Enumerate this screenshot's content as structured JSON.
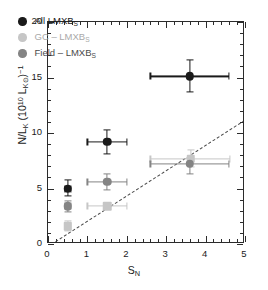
{
  "chart_data": {
    "type": "scatter",
    "title": "",
    "xlabel": "S_N",
    "xlabel_main": "S",
    "xlabel_sub": "N",
    "ylabel": "N/L_K (10^10 L_K⊙)^-1",
    "ylabel_parts": {
      "n_over_l": "N/L",
      "l_sub": "K",
      "paren_open": " (10",
      "exp10": "10",
      "lk": " L",
      "lk_sub": "K⊙",
      "paren_close": ")",
      "exp_minus1": "−1"
    },
    "xlim": [
      0,
      5
    ],
    "ylim": [
      0,
      20
    ],
    "xticks": [
      0,
      1,
      2,
      3,
      4,
      5
    ],
    "xticklabels": [
      "0",
      "1",
      "2",
      "3",
      "4",
      "5"
    ],
    "yticks": [
      0,
      5,
      10,
      15,
      20
    ],
    "yticklabels": [
      "0",
      "5",
      "10",
      "15",
      "20"
    ],
    "x_minor_step": 0.2,
    "y_minor_step": 1,
    "grid": false,
    "legend_position": "upper left",
    "colors": {
      "all": "#1a1a1a",
      "gc": "#c6c6c6",
      "field": "#848484",
      "axis": "#2b2b2b",
      "dashed_line": "#4a4a4a"
    },
    "legend": [
      {
        "label": "All LMXB",
        "label_sub": "S",
        "color_key": "all",
        "series": "all"
      },
      {
        "label": "GC – LMXB",
        "label_sub": "S",
        "color_key": "gc",
        "series": "gc"
      },
      {
        "label": "Field – LMXB",
        "label_sub": "S",
        "color_key": "field",
        "series": "field"
      }
    ],
    "annotations": [
      {
        "type": "dashed_line",
        "x": [
          0.08,
          5.0
        ],
        "y": [
          0.0,
          11.2
        ],
        "note": "one-to-one reference trend"
      }
    ],
    "series": [
      {
        "name": "All LMXBs",
        "color_key": "all",
        "marker": "circle",
        "points": [
          {
            "x": 0.5,
            "y": 5.0,
            "xerr_lo": 0.08,
            "xerr_hi": 0.08,
            "yerr_lo": 0.65,
            "yerr_hi": 0.75
          },
          {
            "x": 1.5,
            "y": 9.2,
            "xerr_lo": 0.5,
            "xerr_hi": 0.5,
            "yerr_lo": 1.1,
            "yerr_hi": 1.1
          },
          {
            "x": 3.6,
            "y": 15.1,
            "xerr_lo": 1.0,
            "xerr_hi": 1.0,
            "yerr_lo": 1.4,
            "yerr_hi": 1.45
          }
        ]
      },
      {
        "name": "GC – LMXBs",
        "color_key": "gc",
        "marker": "square",
        "points": [
          {
            "x": 0.5,
            "y": 1.6,
            "xerr_lo": 0.08,
            "xerr_hi": 0.08,
            "yerr_lo": 0.45,
            "yerr_hi": 0.45
          },
          {
            "x": 1.5,
            "y": 3.4,
            "xerr_lo": 0.5,
            "xerr_hi": 0.5,
            "yerr_lo": 0.0,
            "yerr_hi": 0.0
          },
          {
            "x": 3.62,
            "y": 7.7,
            "xerr_lo": 1.02,
            "xerr_hi": 1.0,
            "yerr_lo": 0.75,
            "yerr_hi": 0.75
          }
        ]
      },
      {
        "name": "Field – LMXBs",
        "color_key": "field",
        "marker": "circle",
        "points": [
          {
            "x": 0.5,
            "y": 3.4,
            "xerr_lo": 0.08,
            "xerr_hi": 0.08,
            "yerr_lo": 0.5,
            "yerr_hi": 0.5
          },
          {
            "x": 1.5,
            "y": 5.6,
            "xerr_lo": 0.5,
            "xerr_hi": 0.5,
            "yerr_lo": 0.75,
            "yerr_hi": 0.75
          },
          {
            "x": 3.6,
            "y": 7.25,
            "xerr_lo": 1.0,
            "xerr_hi": 1.0,
            "yerr_lo": 0.95,
            "yerr_hi": 0.5
          }
        ]
      }
    ]
  }
}
